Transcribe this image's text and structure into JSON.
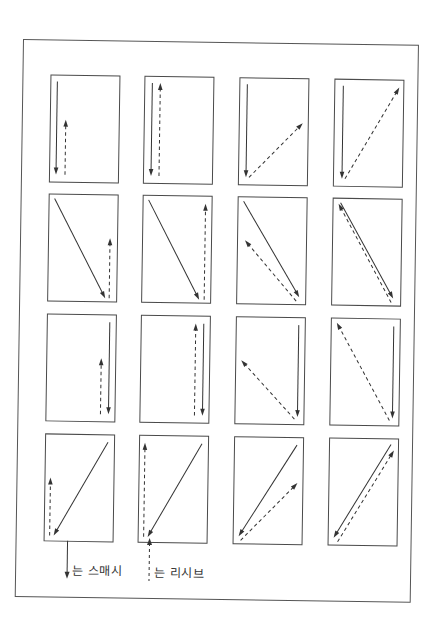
{
  "legend": {
    "smash_label": "는 스매시",
    "receive_label": "는 리시브",
    "smash_style": "solid",
    "receive_style": "dashed"
  },
  "grid": {
    "rows": 4,
    "cols": 4
  },
  "panels": [
    {
      "row": 1,
      "col": 1,
      "smash": [
        7,
        7,
        7,
        100
      ],
      "receive": [
        16,
        100,
        16,
        45
      ]
    },
    {
      "row": 1,
      "col": 2,
      "smash": [
        8,
        7,
        8,
        100
      ],
      "receive": [
        16,
        100,
        16,
        7
      ]
    },
    {
      "row": 1,
      "col": 3,
      "smash": [
        8,
        7,
        8,
        100
      ],
      "receive": [
        11,
        100,
        64,
        45
      ]
    },
    {
      "row": 1,
      "col": 4,
      "smash": [
        9,
        7,
        9,
        100
      ],
      "receive": [
        12,
        100,
        65,
        8
      ]
    },
    {
      "row": 2,
      "col": 1,
      "smash": [
        6,
        5,
        58,
        104
      ],
      "receive": [
        62,
        104,
        62,
        44
      ]
    },
    {
      "row": 2,
      "col": 2,
      "smash": [
        6,
        5,
        58,
        104
      ],
      "receive": [
        63,
        104,
        63,
        8
      ]
    },
    {
      "row": 2,
      "col": 3,
      "smash": [
        6,
        5,
        63,
        100
      ],
      "receive": [
        60,
        104,
        8,
        44
      ]
    },
    {
      "row": 2,
      "col": 4,
      "smash": [
        8,
        5,
        62,
        100
      ],
      "receive": [
        60,
        104,
        6,
        6
      ]
    },
    {
      "row": 3,
      "col": 1,
      "smash": [
        63,
        8,
        63,
        100
      ],
      "receive": [
        55,
        100,
        55,
        44
      ]
    },
    {
      "row": 3,
      "col": 2,
      "smash": [
        63,
        8,
        63,
        100
      ],
      "receive": [
        55,
        100,
        55,
        8
      ]
    },
    {
      "row": 3,
      "col": 3,
      "smash": [
        63,
        8,
        63,
        100
      ],
      "receive": [
        60,
        102,
        6,
        44
      ]
    },
    {
      "row": 3,
      "col": 4,
      "smash": [
        63,
        8,
        63,
        100
      ],
      "receive": [
        60,
        102,
        6,
        5
      ]
    },
    {
      "row": 4,
      "col": 1,
      "smash": [
        63,
        8,
        10,
        102
      ],
      "receive": [
        6,
        102,
        6,
        44
      ]
    },
    {
      "row": 4,
      "col": 2,
      "smash": [
        63,
        8,
        10,
        102
      ],
      "receive": [
        6,
        102,
        6,
        8
      ]
    },
    {
      "row": 4,
      "col": 3,
      "smash": [
        63,
        8,
        6,
        100
      ],
      "receive": [
        8,
        104,
        64,
        46
      ]
    },
    {
      "row": 4,
      "col": 4,
      "smash": [
        62,
        6,
        6,
        100
      ],
      "receive": [
        10,
        104,
        65,
        12
      ]
    }
  ],
  "colors": {
    "line": "#333333",
    "border": "#4a4a4a"
  }
}
